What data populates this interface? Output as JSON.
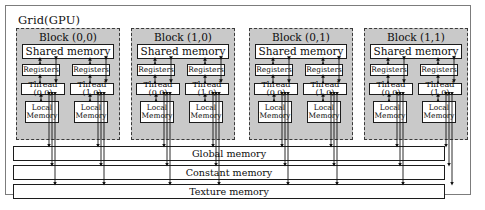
{
  "diagram": {
    "grid": {
      "label": "Grid(GPU)",
      "frame_color": "#7c7c7c",
      "background": "#ffffff"
    },
    "block_defaults": {
      "shared_label": "Shared memory",
      "registers_label": "Registers",
      "local_memory_line1": "Local",
      "local_memory_line2": "Memory",
      "thread_left_label": "Thread (0,0)",
      "thread_right_label": "Thread (1,0)",
      "fill_color": "#c9c9c9",
      "border_style": "dashed",
      "border_color": "#3a3a3a"
    },
    "blocks": [
      {
        "title": "Block (0,0)",
        "shared": "Shared memory",
        "registers": [
          "Registers",
          "Registers"
        ],
        "threads": [
          "Thread (0,0)",
          "Thread (1,0)"
        ],
        "local_memory": [
          "Local Memory",
          "Local Memory"
        ]
      },
      {
        "title": "Block (1,0)",
        "shared": "Shared memory",
        "registers": [
          "Registers",
          "Registers"
        ],
        "threads": [
          "Thread (0,0)",
          "Thread (1,0)"
        ],
        "local_memory": [
          "Local Memory",
          "Local Memory"
        ]
      },
      {
        "title": "Block (0,1)",
        "shared": "Shared memory",
        "registers": [
          "Registers",
          "Registers"
        ],
        "threads": [
          "Thread (0,0)",
          "Thread (1,0)"
        ],
        "local_memory": [
          "Local Memory",
          "Local Memory"
        ]
      },
      {
        "title": "Block (1,1)",
        "shared": "Shared memory",
        "registers": [
          "Registers",
          "Registers"
        ],
        "threads": [
          "Thread (0,0)",
          "Thread (1,0)"
        ],
        "local_memory": [
          "Local Memory",
          "Local Memory"
        ]
      }
    ],
    "global_bars": [
      {
        "label": "Global memory"
      },
      {
        "label": "Constant memory"
      },
      {
        "label": "Texture memory"
      }
    ],
    "colors": {
      "box_fill": "#ffffff",
      "box_border": "#1c1c1c",
      "block_fill": "#c9c9c9",
      "arrow": "#141414",
      "page_background": "#ffffff"
    }
  }
}
